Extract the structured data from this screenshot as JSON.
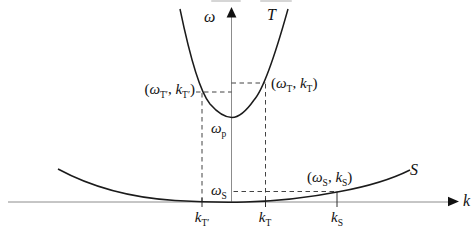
{
  "figure": {
    "axes": {
      "y_label": "ω",
      "x_label": "k"
    },
    "curve_labels": {
      "T": "T",
      "S": "S"
    },
    "annotations": {
      "point_t_scattered": {
        "open_paren": "(",
        "omega": "ω",
        "omega_sub": "T′",
        "comma": ", ",
        "k": "k",
        "k_sub": "T′",
        "close_paren": ")"
      },
      "point_t_incident": {
        "open_paren": "(",
        "omega": "ω",
        "omega_sub": "T",
        "comma": ", ",
        "k": "k",
        "k_sub": "T",
        "close_paren": ")"
      },
      "point_s": {
        "open_paren": "(",
        "omega": "ω",
        "omega_sub": "S",
        "comma": ", ",
        "k": "k",
        "k_sub": "S",
        "close_paren": ")"
      },
      "omega_p": {
        "base": "ω",
        "sub": "p"
      },
      "omega_s": {
        "base": "ω",
        "sub": "S"
      }
    },
    "x_ticks": [
      {
        "base": "k",
        "sub": "T′"
      },
      {
        "base": "k",
        "sub": "T"
      },
      {
        "base": "k",
        "sub": "S"
      }
    ],
    "colors": {
      "curve": "#1b1b1b",
      "axis": "#8c8c8c",
      "dashed": "#2e2e2e",
      "text": "#111111",
      "background": "#ffffff"
    }
  }
}
